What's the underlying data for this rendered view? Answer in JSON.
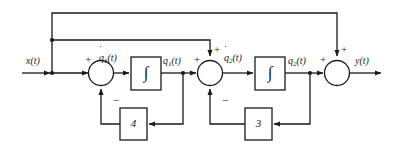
{
  "diagram": {
    "type": "signal-flow-block-diagram",
    "stroke_color": "#1a1a1a",
    "block_fill": "#ffffff",
    "background": "#ffffff",
    "input": {
      "label": "x(t)",
      "name": "input-signal"
    },
    "output": {
      "label": "y(t)",
      "name": "output-signal"
    },
    "signals": [
      {
        "id": "qdot1",
        "label_base": "q",
        "label_sub": "1",
        "label_tail": "(t)",
        "label_full": "q̇1(t)",
        "dot": true
      },
      {
        "id": "q1",
        "label_base": "q",
        "label_sub": "1",
        "label_tail": "(t)",
        "label_full": "q1(t)",
        "dot": false
      },
      {
        "id": "qdot2",
        "label_base": "q",
        "label_sub": "2",
        "label_tail": "(t)",
        "label_full": "q̇2(t)",
        "dot": true
      },
      {
        "id": "q2",
        "label_base": "q",
        "label_sub": "2",
        "label_tail": "(t)",
        "label_full": "q2(t)",
        "dot": false
      }
    ],
    "integrators": [
      {
        "id": "integrator-1",
        "glyph": "∫"
      },
      {
        "id": "integrator-2",
        "glyph": "∫"
      }
    ],
    "gains": [
      {
        "id": "gain-4",
        "value": "4"
      },
      {
        "id": "gain-3",
        "value": "3"
      }
    ],
    "summers": [
      {
        "id": "summer-1",
        "signs": [
          {
            "position": "left",
            "symbol": "+"
          },
          {
            "position": "bottom",
            "symbol": "−"
          }
        ]
      },
      {
        "id": "summer-2",
        "signs": [
          {
            "position": "left",
            "symbol": "+"
          },
          {
            "position": "top",
            "symbol": "+"
          },
          {
            "position": "bottom",
            "symbol": "−"
          }
        ]
      },
      {
        "id": "summer-3",
        "signs": [
          {
            "position": "left",
            "symbol": "+"
          },
          {
            "position": "top",
            "symbol": "+"
          }
        ]
      }
    ]
  }
}
